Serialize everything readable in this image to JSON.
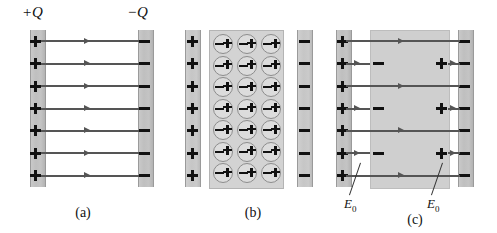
{
  "figure": {
    "title_labels": {
      "positive_charge": "+Q",
      "negative_charge": "−Q"
    },
    "captions": {
      "a": "(a)",
      "b": "(b)",
      "c": "(c)"
    },
    "field_labels": {
      "left": "E",
      "left_sub": "0",
      "right": "E",
      "right_sub": "0"
    },
    "glyphs": {
      "plus": "+",
      "minus": "−"
    },
    "colors": {
      "plate_fill": "#c4c4c4",
      "plate_edge": "#9a9a9a",
      "dielectric_fill": "#d3d3d3",
      "dielectric_edge": "#b4b4b4",
      "field_line": "#555555",
      "charge": "#111111",
      "background": "#ffffff"
    },
    "panels": [
      {
        "id": "a",
        "name": "capacitor-without-dielectric",
        "caption": "(a)",
        "left_plate_charges": 7,
        "right_plate_charges": 7,
        "field_lines": 7,
        "has_dielectric": false
      },
      {
        "id": "b",
        "name": "dielectric-slab-polarized-molecules",
        "caption": "(b)",
        "left_plate_charges": 7,
        "right_plate_charges": 7,
        "field_lines": 0,
        "has_dielectric": true,
        "molecule_rows": 7,
        "molecule_cols": 3,
        "molecule_total": 21
      },
      {
        "id": "c",
        "name": "capacitor-with-dielectric-inserted",
        "caption": "(c)",
        "left_plate_charges": 7,
        "right_plate_charges": 7,
        "field_lines": 4,
        "has_dielectric": true,
        "induced_negative_charges": 3,
        "induced_positive_charges": 3,
        "gap_arrows_left": 3,
        "gap_arrows_right": 3
      }
    ]
  }
}
